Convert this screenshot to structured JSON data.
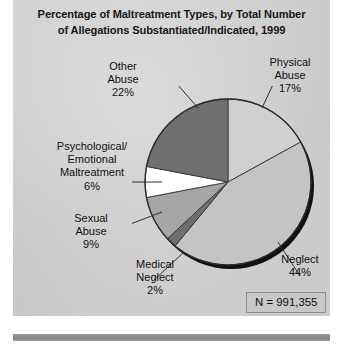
{
  "chart_data": {
    "type": "pie",
    "title": "Percentage of Maltreatment Types, by Total Number of Allegations Substantiated/Indicated, 1999",
    "title_lines": [
      "Percentage of Maltreatment Types, by Total Number",
      "of Allegations Substantiated/Indicated, 1999"
    ],
    "categories": [
      "Physical Abuse",
      "Neglect",
      "Medical Neglect",
      "Sexual Abuse",
      "Psychological/Emotional Maltreatment",
      "Other Abuse"
    ],
    "values": [
      17,
      44,
      2,
      9,
      6,
      22
    ],
    "unit": "%",
    "total_label": "N = 991,355",
    "total_value": 991355,
    "legend": "none",
    "start_angle_deg": 0,
    "direction": "clockwise",
    "slices": [
      {
        "name": "Physical Abuse",
        "value": 17,
        "color": "#d0d0d0",
        "start_deg": 0,
        "end_deg": 61.2
      },
      {
        "name": "Neglect",
        "value": 44,
        "color": "#c4c4c4",
        "start_deg": 61.2,
        "end_deg": 219.6
      },
      {
        "name": "Medical Neglect",
        "value": 2,
        "color": "#6e6e6e",
        "start_deg": 219.6,
        "end_deg": 226.8
      },
      {
        "name": "Sexual Abuse",
        "value": 9,
        "color": "#a6a6a6",
        "start_deg": 226.8,
        "end_deg": 259.2
      },
      {
        "name": "Psychological/Emotional Maltreatment",
        "value": 6,
        "color": "#ffffff",
        "start_deg": 259.2,
        "end_deg": 280.8
      },
      {
        "name": "Other Abuse",
        "value": 22,
        "color": "#6f6f6f",
        "start_deg": 280.8,
        "end_deg": 360
      }
    ]
  },
  "labels": {
    "other_abuse": {
      "lines": [
        "Other",
        "Abuse",
        "22%"
      ]
    },
    "physical": {
      "lines": [
        "Physical",
        "Abuse",
        "17%"
      ]
    },
    "psychological": {
      "lines": [
        "Psychological/",
        "Emotional",
        "Maltreatment",
        "6%"
      ]
    },
    "sexual": {
      "lines": [
        "Sexual",
        "Abuse",
        "9%"
      ]
    },
    "medical": {
      "lines": [
        "Medical",
        "Neglect",
        "2%"
      ]
    },
    "neglect": {
      "lines": [
        "Neglect",
        "44%"
      ]
    }
  },
  "footnote": {
    "n_label": "N = 991,355"
  },
  "colors": {
    "panel_background": "#d2d2d2",
    "page_background": "#ffffff",
    "text": "#111111",
    "rule": "#8f8f8f",
    "pie_outline": "#2a2a2a",
    "pie_shadow": "#101010"
  }
}
